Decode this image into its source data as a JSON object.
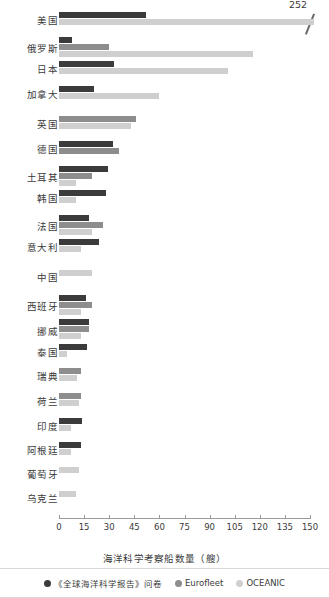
{
  "chart_data": {
    "type": "bar",
    "orientation": "horizontal",
    "title": "",
    "xlabel": "海洋科学考察船数量（艘）",
    "ylabel": "",
    "xlim": [
      0,
      150
    ],
    "xticks": [
      0,
      15,
      30,
      45,
      60,
      75,
      90,
      105,
      120,
      135,
      150
    ],
    "grid": false,
    "legend_position": "bottom",
    "categories": [
      "美国",
      "俄罗斯",
      "日本",
      "加拿大",
      "英国",
      "德国",
      "土耳其",
      "韩国",
      "法国",
      "意大利",
      "中国",
      "西班牙",
      "挪威",
      "泰国",
      "瑞典",
      "荷兰",
      "印度",
      "阿根廷",
      "葡萄牙",
      "乌克兰"
    ],
    "series": [
      {
        "name": "《全球海洋科学报告》问卷",
        "color": "#3b3b3b",
        "values": [
          52,
          8,
          33,
          21,
          0,
          32,
          29,
          28,
          18,
          24,
          0,
          16,
          18,
          17,
          0,
          0,
          14,
          13,
          0,
          0
        ]
      },
      {
        "name": "Eurofleet",
        "color": "#8d8d8d",
        "values": [
          0,
          30,
          0,
          0,
          46,
          36,
          20,
          0,
          26,
          0,
          0,
          20,
          18,
          0,
          13,
          13,
          0,
          0,
          0,
          0
        ]
      },
      {
        "name": "OCEANIC",
        "color": "#cfcfcf",
        "values": [
          252,
          116,
          101,
          60,
          43,
          0,
          10,
          10,
          20,
          13,
          20,
          13,
          13,
          5,
          11,
          12,
          7,
          7,
          12,
          10
        ]
      }
    ],
    "annotations": [
      {
        "label": "252",
        "series": "OCEANIC",
        "category": "美国",
        "note": "axis-break: bar extends past 150 and is truncated with a break slash"
      }
    ]
  },
  "legend": {
    "items": [
      {
        "label": "《全球海洋科学报告》问卷",
        "color": "#3b3b3b"
      },
      {
        "label": "Eurofleet",
        "color": "#8d8d8d"
      },
      {
        "label": "OCEANIC",
        "color": "#cfcfcf"
      }
    ]
  }
}
